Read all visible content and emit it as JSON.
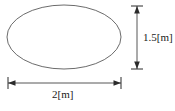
{
  "figure": {
    "shape": {
      "name": "ellipse",
      "stroke_color": "#5a5a5a",
      "fill_color": "#ffffff",
      "center_x": 64,
      "center_y": 37,
      "radius_x": 57,
      "radius_y": 32
    },
    "background_color": "#ffffff",
    "line_color": "#2b2b2b"
  },
  "dimensions": {
    "height": {
      "label": "1.5[m]",
      "value": 1.5,
      "unit": "m",
      "orientation": "vertical",
      "line_x": 137,
      "line_y_start": 6,
      "line_y_end": 69,
      "extension_half_width": 6
    },
    "width": {
      "label": "2[m]",
      "value": 2,
      "unit": "m",
      "orientation": "horizontal",
      "line_y": 83,
      "line_x_start": 8,
      "line_x_end": 121,
      "extension_half_height": 6
    }
  },
  "icons": {
    "arrow_up": "arrow-up-icon",
    "arrow_down": "arrow-down-icon",
    "arrow_left": "arrow-left-icon",
    "arrow_right": "arrow-right-icon"
  }
}
